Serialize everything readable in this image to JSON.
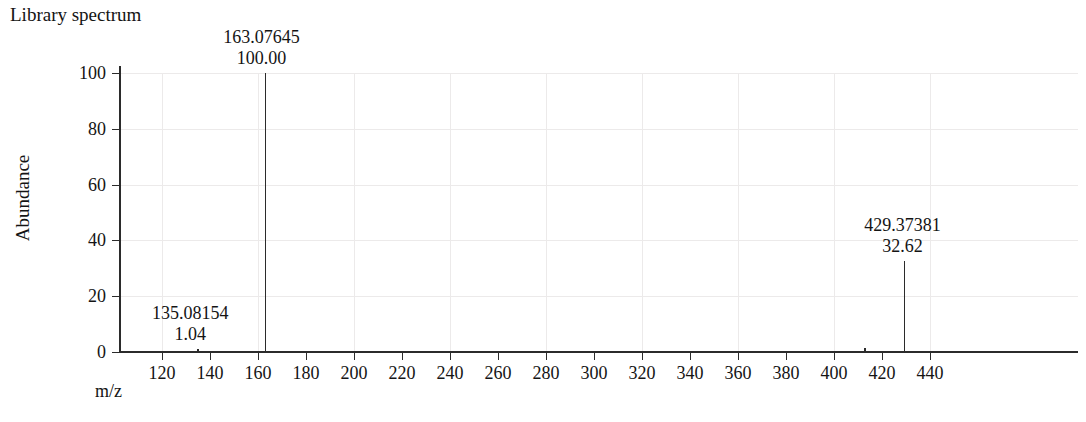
{
  "chart_data": {
    "type": "bar",
    "title": "Library spectrum",
    "xlabel": "m/z",
    "ylabel": "Abundance",
    "xlim": [
      108,
      448
    ],
    "ylim": [
      0,
      100
    ],
    "grid": true,
    "legend": "none",
    "x_ticks": [
      120,
      140,
      160,
      180,
      200,
      220,
      240,
      260,
      280,
      300,
      320,
      340,
      360,
      380,
      400,
      420,
      440
    ],
    "y_ticks": [
      0,
      20,
      40,
      60,
      80,
      100
    ],
    "x_tick_labels": [
      "120",
      "140",
      "160",
      "180",
      "200",
      "220",
      "240",
      "260",
      "280",
      "300",
      "320",
      "340",
      "360",
      "380",
      "400",
      "420",
      "440"
    ],
    "y_tick_labels": [
      "100",
      "80",
      "60",
      "40",
      "20",
      "0"
    ],
    "peaks": [
      {
        "mz": 135.08154,
        "abundance": 1.04,
        "mz_label": "135.08154",
        "abundance_label": "1.04",
        "labeled": true,
        "label_align": "center",
        "label_offset_x": -8
      },
      {
        "mz": 163.07645,
        "abundance": 100.0,
        "mz_label": "163.07645",
        "abundance_label": "100.00",
        "labeled": true,
        "label_align": "center",
        "label_offset_x": -4
      },
      {
        "mz": 413.0,
        "abundance": 1.6,
        "mz_label": "",
        "abundance_label": "",
        "labeled": false,
        "label_align": "center",
        "label_offset_x": 0
      },
      {
        "mz": 429.37381,
        "abundance": 32.62,
        "mz_label": "429.37381",
        "abundance_label": "32.62",
        "labeled": true,
        "label_align": "center",
        "label_offset_x": -2
      }
    ],
    "series": [
      {
        "name": "Library spectrum",
        "x": [
          135.08154,
          163.07645,
          413.0,
          429.37381
        ],
        "values": [
          1.04,
          100.0,
          1.6,
          32.62
        ]
      }
    ]
  },
  "colors": {
    "axis": "#2b2b2b",
    "peak": "#2b2b2b",
    "grid": "#eceaea",
    "text": "#141414",
    "background": "#ffffff"
  }
}
